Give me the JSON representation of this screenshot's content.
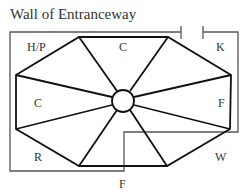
{
  "title": "Wall of Entranceway",
  "regions": [
    {
      "id": "top-left",
      "label": "H/P"
    },
    {
      "id": "top",
      "label": "C"
    },
    {
      "id": "top-right",
      "label": "K"
    },
    {
      "id": "left",
      "label": "C"
    },
    {
      "id": "right",
      "label": "F"
    },
    {
      "id": "bottom-left",
      "label": "R"
    },
    {
      "id": "bottom-right",
      "label": "W"
    },
    {
      "id": "bottom",
      "label": "F"
    }
  ],
  "colors": {
    "outline": "#111111",
    "wall": "#555555",
    "text": "#333333"
  }
}
